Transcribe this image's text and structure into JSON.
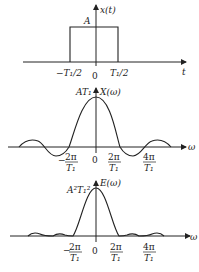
{
  "panels": [
    {
      "id": "time-domain",
      "y_label": "x(t)",
      "x_label": "t",
      "amplitude_label": "A",
      "ticks": [
        "−T₁/2",
        "0",
        "T₁/2"
      ]
    },
    {
      "id": "spectrum",
      "y_label": "X(ω)",
      "x_label": "ω",
      "amplitude_label": "AT₁",
      "ticks": {
        "neg2pi_num": "2π",
        "neg2pi_den": "T₁",
        "neg_sign": "−",
        "zero": "0",
        "pos2pi_num": "2π",
        "pos2pi_den": "T₁",
        "pos4pi_num": "4π",
        "pos4pi_den": "T₁"
      }
    },
    {
      "id": "energy-spectrum",
      "y_label": "E(ω)",
      "x_label": "ω",
      "amplitude_label": "A²T₁²",
      "ticks": {
        "neg2pi_num": "2π",
        "neg2pi_den": "T₁",
        "neg_sign": "−",
        "zero": "0",
        "pos2pi_num": "2π",
        "pos2pi_den": "T₁",
        "pos4pi_num": "4π",
        "pos4pi_den": "T₁"
      }
    }
  ],
  "colors": {
    "line": "#222222",
    "background": "#ffffff"
  }
}
